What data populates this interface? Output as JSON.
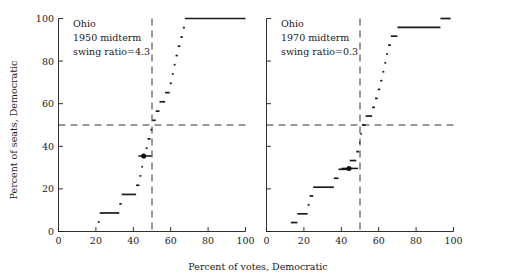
{
  "figure": {
    "axis": {
      "xlabel": "Percent of votes, Democratic",
      "ylabel": "Percent of seats, Democratic",
      "xticks": [
        "0",
        "20",
        "40",
        "60",
        "80",
        "100"
      ],
      "yticks": [
        "0",
        "20",
        "40",
        "60",
        "80",
        "100"
      ],
      "xlim": [
        0,
        100
      ],
      "ylim": [
        0,
        100
      ],
      "reference_x": 50,
      "reference_y": 50
    },
    "panels": [
      {
        "id": "left",
        "annotations": [
          "Ohio",
          "1950 midterm",
          "swing ratio=4.3"
        ],
        "state": "Ohio",
        "year_label": "1950 midterm",
        "swing_ratio_label": "swing ratio=4.3",
        "swing_ratio": 4.3,
        "observed_marker": {
          "x": 45.4,
          "y": 35.0,
          "x_low": 43.6,
          "x_high": 47.2
        }
      },
      {
        "id": "right",
        "annotations": [
          "Ohio",
          "1970 midterm",
          "swing ratio=0.3"
        ],
        "state": "Ohio",
        "year_label": "1970 midterm",
        "swing_ratio_label": "swing ratio=0.3",
        "swing_ratio": 0.3,
        "observed_marker": {
          "x": 44.0,
          "y": 29.0,
          "x_low": 40.5,
          "x_high": 47.0
        }
      }
    ]
  },
  "chart_data": {
    "type": "line",
    "title": "",
    "subtitle": "",
    "xlabel": "Percent of votes, Democratic",
    "ylabel": "Percent of seats, Democratic",
    "xlim": [
      0,
      100
    ],
    "ylim": [
      0,
      100
    ],
    "xticks": [
      0,
      20,
      40,
      60,
      80,
      100
    ],
    "yticks": [
      0,
      20,
      40,
      60,
      80,
      100
    ],
    "grid": false,
    "legend": "none",
    "annotations": [
      {
        "panel": "left",
        "text": "Ohio"
      },
      {
        "panel": "left",
        "text": "1950 midterm"
      },
      {
        "panel": "left",
        "text": "swing ratio=4.3"
      },
      {
        "panel": "right",
        "text": "Ohio"
      },
      {
        "panel": "right",
        "text": "1970 midterm"
      },
      {
        "panel": "right",
        "text": "swing ratio=0.3"
      }
    ],
    "reference_lines": [
      {
        "orientation": "horizontal",
        "value": 50,
        "style": "dashed"
      },
      {
        "orientation": "vertical",
        "value": 50,
        "style": "dashed"
      }
    ],
    "panels": [
      {
        "name": "Ohio 1950 midterm",
        "swing_ratio": 4.3,
        "series": [
          {
            "name": "seats-votes staircase",
            "type": "step",
            "segments": [
              {
                "x0": 21.0,
                "x1": 22.0,
                "y": 4.5
              },
              {
                "x0": 22.0,
                "x1": 32.5,
                "y": 8.7
              },
              {
                "x0": 32.5,
                "x1": 33.8,
                "y": 13.0
              },
              {
                "x0": 33.8,
                "x1": 41.5,
                "y": 17.4
              },
              {
                "x0": 41.5,
                "x1": 43.3,
                "y": 21.7
              },
              {
                "x0": 43.3,
                "x1": 44.3,
                "y": 26.1
              },
              {
                "x0": 44.3,
                "x1": 45.2,
                "y": 30.4
              },
              {
                "x0": 45.2,
                "x1": 46.6,
                "y": 34.8
              },
              {
                "x0": 46.6,
                "x1": 47.6,
                "y": 39.1
              },
              {
                "x0": 47.6,
                "x1": 49.2,
                "y": 43.5
              },
              {
                "x0": 49.2,
                "x1": 50.2,
                "y": 47.8
              },
              {
                "x0": 50.2,
                "x1": 52.0,
                "y": 52.2
              },
              {
                "x0": 52.0,
                "x1": 54.0,
                "y": 56.5
              },
              {
                "x0": 54.0,
                "x1": 57.0,
                "y": 60.9
              },
              {
                "x0": 57.0,
                "x1": 59.5,
                "y": 65.2
              },
              {
                "x0": 59.5,
                "x1": 60.6,
                "y": 69.6
              },
              {
                "x0": 60.6,
                "x1": 61.6,
                "y": 73.9
              },
              {
                "x0": 61.6,
                "x1": 62.6,
                "y": 78.3
              },
              {
                "x0": 62.6,
                "x1": 63.8,
                "y": 82.6
              },
              {
                "x0": 63.8,
                "x1": 65.2,
                "y": 87.0
              },
              {
                "x0": 65.2,
                "x1": 66.5,
                "y": 91.3
              },
              {
                "x0": 66.5,
                "x1": 67.6,
                "y": 95.7
              },
              {
                "x0": 67.6,
                "x1": 100.0,
                "y": 100.0
              }
            ]
          }
        ],
        "observed_point": {
          "x": 45.4,
          "y": 35.0
        }
      },
      {
        "name": "Ohio 1970 midterm",
        "swing_ratio": 0.3,
        "series": [
          {
            "name": "seats-votes staircase",
            "type": "step",
            "segments": [
              {
                "x0": 13.0,
                "x1": 16.5,
                "y": 4.2
              },
              {
                "x0": 16.5,
                "x1": 22.0,
                "y": 8.3
              },
              {
                "x0": 22.0,
                "x1": 23.0,
                "y": 12.5
              },
              {
                "x0": 23.0,
                "x1": 25.0,
                "y": 16.7
              },
              {
                "x0": 25.0,
                "x1": 36.0,
                "y": 20.8
              },
              {
                "x0": 36.0,
                "x1": 38.5,
                "y": 25.0
              },
              {
                "x0": 38.5,
                "x1": 44.5,
                "y": 29.2
              },
              {
                "x0": 44.5,
                "x1": 48.0,
                "y": 33.3
              },
              {
                "x0": 48.0,
                "x1": 49.5,
                "y": 37.5
              },
              {
                "x0": 49.5,
                "x1": 50.2,
                "y": 41.7
              },
              {
                "x0": 50.2,
                "x1": 51.0,
                "y": 45.8
              },
              {
                "x0": 51.0,
                "x1": 53.0,
                "y": 50.0
              },
              {
                "x0": 53.0,
                "x1": 56.5,
                "y": 54.2
              },
              {
                "x0": 56.5,
                "x1": 58.0,
                "y": 58.3
              },
              {
                "x0": 58.0,
                "x1": 59.5,
                "y": 62.5
              },
              {
                "x0": 59.5,
                "x1": 60.8,
                "y": 66.7
              },
              {
                "x0": 60.8,
                "x1": 62.0,
                "y": 70.8
              },
              {
                "x0": 62.0,
                "x1": 63.0,
                "y": 75.0
              },
              {
                "x0": 63.0,
                "x1": 64.0,
                "y": 79.2
              },
              {
                "x0": 64.0,
                "x1": 65.0,
                "y": 83.3
              },
              {
                "x0": 65.0,
                "x1": 66.5,
                "y": 87.5
              },
              {
                "x0": 66.5,
                "x1": 70.0,
                "y": 91.7
              },
              {
                "x0": 70.0,
                "x1": 93.0,
                "y": 95.8
              },
              {
                "x0": 93.0,
                "x1": 98.5,
                "y": 100.0
              }
            ]
          }
        ],
        "observed_point": {
          "x": 44.0,
          "y": 29.0
        }
      }
    ]
  }
}
